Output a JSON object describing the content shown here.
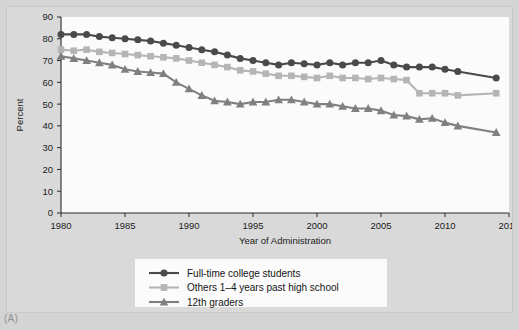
{
  "figure": {
    "panel_label": "(A)",
    "background_color": "#d4d4d4",
    "plot_background_color": "#fbfbfb"
  },
  "chart_data": {
    "type": "line",
    "title": "",
    "subtitle": "",
    "xlabel": "Year of Administration",
    "ylabel": "Percent",
    "xlim": [
      1980,
      2015
    ],
    "ylim": [
      0,
      90
    ],
    "xticks": [
      1980,
      1985,
      1990,
      1995,
      2000,
      2005,
      2010,
      2015
    ],
    "xtick_labels": [
      "1980",
      "1985",
      "1990",
      "1995",
      "2000",
      "2005",
      "2010",
      "2015"
    ],
    "yticks": [
      0,
      10,
      20,
      30,
      40,
      50,
      60,
      70,
      80,
      90
    ],
    "ytick_labels": [
      "0",
      "10",
      "20",
      "30",
      "40",
      "50",
      "60",
      "70",
      "80",
      "90"
    ],
    "grid": false,
    "legend_position": "bottom-center",
    "series": [
      {
        "name": "Full-time college students",
        "color": "#4a4a4a",
        "marker": "circle",
        "x": [
          1980,
          1981,
          1982,
          1983,
          1984,
          1985,
          1986,
          1987,
          1988,
          1989,
          1990,
          1991,
          1992,
          1993,
          1994,
          1995,
          1996,
          1997,
          1998,
          1999,
          2000,
          2001,
          2002,
          2003,
          2004,
          2005,
          2006,
          2007,
          2008,
          2009,
          2010,
          2011,
          2014
        ],
        "values": [
          82,
          82,
          82,
          81,
          80.5,
          80,
          79.5,
          79,
          78,
          77,
          76,
          75,
          74,
          72.5,
          71,
          70,
          69,
          68,
          69,
          68.5,
          68,
          69,
          68,
          69,
          69,
          70,
          68,
          67,
          67,
          67,
          66,
          65,
          62
        ]
      },
      {
        "name": "Others 1–4 years past high school",
        "color": "#b5b5b5",
        "marker": "square",
        "x": [
          1980,
          1981,
          1982,
          1983,
          1984,
          1985,
          1986,
          1987,
          1988,
          1989,
          1990,
          1991,
          1992,
          1993,
          1994,
          1995,
          1996,
          1997,
          1998,
          1999,
          2000,
          2001,
          2002,
          2003,
          2004,
          2005,
          2006,
          2007,
          2008,
          2009,
          2010,
          2011,
          2014
        ],
        "values": [
          75,
          74.5,
          75,
          74,
          73.5,
          73,
          72.5,
          72,
          71.5,
          71,
          70,
          69,
          68,
          67,
          65.5,
          65,
          64,
          63,
          63,
          62.5,
          62,
          63,
          62,
          62,
          61.5,
          62,
          61.5,
          61,
          55,
          55,
          55,
          54,
          55
        ]
      },
      {
        "name": "12th graders",
        "color": "#808080",
        "marker": "triangle",
        "x": [
          1980,
          1981,
          1982,
          1983,
          1984,
          1985,
          1986,
          1987,
          1988,
          1989,
          1990,
          1991,
          1992,
          1993,
          1994,
          1995,
          1996,
          1997,
          1998,
          1999,
          2000,
          2001,
          2002,
          2003,
          2004,
          2005,
          2006,
          2007,
          2008,
          2009,
          2010,
          2011,
          2014
        ],
        "values": [
          72,
          71,
          70,
          69,
          68,
          66,
          65,
          64.5,
          64,
          60,
          57,
          54,
          51.5,
          51,
          50,
          51,
          51,
          52,
          52,
          51,
          50,
          50,
          49,
          48,
          48,
          47,
          45,
          44.5,
          43,
          43.5,
          41.5,
          40,
          37
        ]
      }
    ]
  },
  "legend": {
    "entries": [
      {
        "label": "Full-time college students",
        "color": "#4a4a4a",
        "marker": "circle"
      },
      {
        "label": "Others 1–4 years past high school",
        "color": "#b5b5b5",
        "marker": "square"
      },
      {
        "label": "12th graders",
        "color": "#808080",
        "marker": "triangle"
      }
    ]
  }
}
